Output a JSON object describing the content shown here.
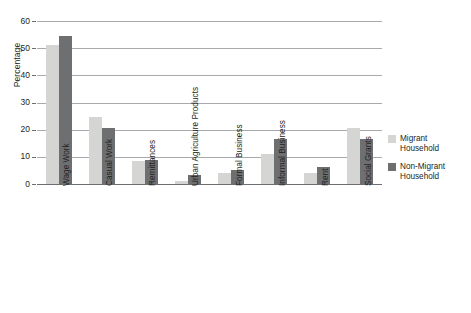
{
  "chart_data": {
    "type": "bar",
    "title": "",
    "xlabel": "",
    "ylabel": "Percentage",
    "ylim": [
      0,
      60
    ],
    "ytick_labels": [
      "60",
      "50",
      "40",
      "30",
      "20",
      "10",
      "0"
    ],
    "ytick_values": [
      60,
      50,
      40,
      30,
      20,
      10,
      0
    ],
    "grid": true,
    "legend_position": "right",
    "categories": [
      "Wage Work",
      "Casual Work",
      "Remittances",
      "Urban Agriculture Products",
      "Formal Business",
      "Informal Business",
      "Rent",
      "Social Grants"
    ],
    "series": [
      {
        "name": "Migrant Household",
        "color": "#d5d5d3",
        "values": [
          51.2,
          24.5,
          8.3,
          1.2,
          4.0,
          11.0,
          4.0,
          20.5
        ]
      },
      {
        "name": "Non-Migrant Household",
        "color": "#6e6f71",
        "values": [
          54.5,
          20.5,
          9.0,
          3.5,
          5.0,
          16.7,
          6.3,
          16.7
        ]
      }
    ]
  },
  "legend": {
    "items": [
      {
        "label": "Migrant Household"
      },
      {
        "label": "Non-Migrant Household"
      }
    ]
  },
  "colors": {
    "migrant": "#d5d5d3",
    "non_migrant": "#6e6f71",
    "gridline": "#a7a9ac",
    "axis": "#6d6e71",
    "text": "#231f20"
  }
}
